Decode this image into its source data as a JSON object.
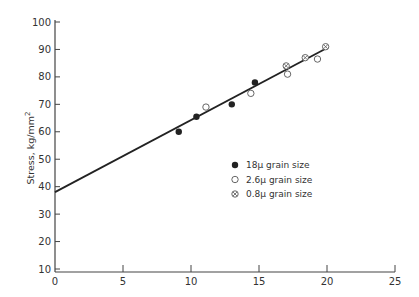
{
  "chart_data": {
    "type": "scatter",
    "title": "",
    "xlabel": "",
    "ylabel": "Stress, kg/mm²",
    "xlim": [
      0,
      25
    ],
    "ylim": [
      10,
      100
    ],
    "x_ticks": [
      0,
      5,
      10,
      15,
      20,
      25
    ],
    "y_ticks": [
      10,
      20,
      30,
      40,
      50,
      60,
      70,
      80,
      90,
      100
    ],
    "grid": false,
    "legend_position": "center-right",
    "series": [
      {
        "name": "18μ grain size",
        "marker": "filled-circle",
        "points": [
          [
            9.1,
            60
          ],
          [
            10.4,
            65.5
          ],
          [
            13.0,
            70
          ],
          [
            14.7,
            78
          ]
        ]
      },
      {
        "name": "2.6μ grain size",
        "marker": "open-circle",
        "points": [
          [
            11.1,
            69
          ],
          [
            14.4,
            74
          ],
          [
            17.1,
            81
          ],
          [
            19.3,
            86.5
          ]
        ]
      },
      {
        "name": "0.8μ grain size",
        "marker": "crossed-circle",
        "points": [
          [
            17.0,
            84
          ],
          [
            18.4,
            87
          ],
          [
            19.9,
            91
          ]
        ]
      }
    ],
    "fit_line": {
      "x": [
        0,
        20
      ],
      "y": [
        38,
        90.5
      ]
    }
  },
  "axes": {
    "ylabel": "Stress, kg/mm",
    "ylabel_sup": "2"
  },
  "legend": [
    {
      "label": "18μ grain size",
      "marker": "filled-circle"
    },
    {
      "label": "2.6μ grain size",
      "marker": "open-circle"
    },
    {
      "label": "0.8μ grain size",
      "marker": "crossed-circle"
    }
  ],
  "colors": {
    "ink": "#222222",
    "axis": "#444444",
    "background": "#ffffff"
  }
}
